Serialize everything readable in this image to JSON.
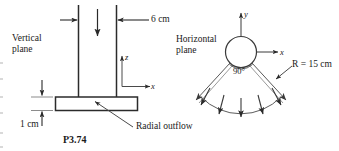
{
  "figure": {
    "caption": "P3.74",
    "left_panel": {
      "plane_label_line1": "Vertical",
      "plane_label_line2": "plane",
      "pipe_diameter_label": "6 cm",
      "gap_height_label": "1 cm",
      "axis_z": "z",
      "axis_x": "x",
      "outflow_label": "Radial outflow"
    },
    "right_panel": {
      "plane_label_line1": "Horizontal",
      "plane_label_line2": "plane",
      "axis_y": "y",
      "axis_x": "x",
      "angle_label": "90°",
      "radius_label": "R = 15 cm"
    },
    "colors": {
      "ink": "#1a1a1a",
      "line": "#333333",
      "background": "#ffffff"
    }
  }
}
